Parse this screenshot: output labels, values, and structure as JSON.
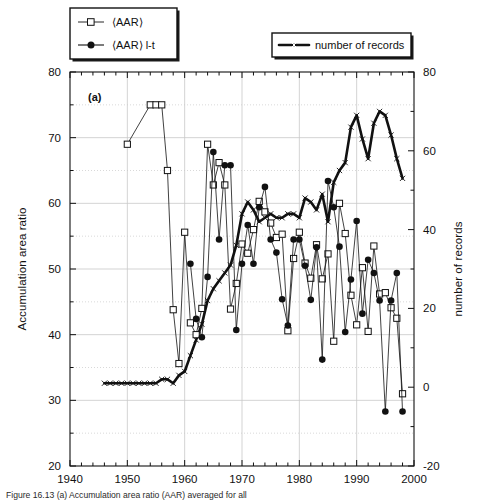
{
  "figure": {
    "panel_label": "(a)",
    "caption": "Figure 16.13   (a) Accumulation area ratio (AAR) averaged for all"
  },
  "legends": [
    {
      "id": "legend-aar",
      "entries": [
        {
          "label": "⟨AAR⟩",
          "marker": "open-square"
        },
        {
          "label": "⟨AAR⟩ l-t",
          "marker": "filled-circle"
        }
      ]
    },
    {
      "id": "legend-records",
      "entries": [
        {
          "label": "number of records",
          "marker": "cross"
        }
      ]
    }
  ],
  "colors": {
    "ink": "#111111",
    "grid": "#c8c8c8",
    "background": "#ffffff"
  },
  "chart_data": {
    "type": "line",
    "title": "",
    "xlabel": "",
    "ylabel": "Accumulation area ratio",
    "y2label": "number  of  records",
    "xlim": [
      1940,
      2000
    ],
    "ylim": [
      20,
      80
    ],
    "y2lim": [
      -20,
      80
    ],
    "xticks": [
      1940,
      1950,
      1960,
      1970,
      1980,
      1990,
      2000
    ],
    "yticks": [
      20,
      30,
      40,
      50,
      60,
      70,
      80
    ],
    "y2ticks": [
      -20,
      0,
      20,
      40,
      60,
      80
    ],
    "xminor_step": 2,
    "yminor_step": 5,
    "grid": true,
    "legend_position": "top",
    "series": [
      {
        "name": "⟨AAR⟩",
        "axis": "left",
        "marker": "open-square",
        "x": [
          1950,
          1954,
          1955,
          1956,
          1957,
          1958,
          1959,
          1960,
          1961,
          1962,
          1963,
          1964,
          1965,
          1966,
          1967,
          1968,
          1969,
          1970,
          1971,
          1972,
          1973,
          1974,
          1975,
          1976,
          1977,
          1978,
          1979,
          1980,
          1981,
          1982,
          1983,
          1984,
          1985,
          1986,
          1987,
          1988,
          1989,
          1990,
          1991,
          1992,
          1993,
          1994,
          1995,
          1996,
          1997,
          1998
        ],
        "y": [
          69.0,
          75.0,
          75.0,
          75.0,
          65.0,
          43.8,
          35.6,
          55.6,
          41.8,
          40.0,
          44.0,
          69.0,
          62.8,
          66.2,
          62.8,
          43.9,
          47.8,
          53.8,
          52.4,
          56.0,
          60.3,
          58.7,
          57.0,
          54.8,
          55.3,
          40.6,
          51.6,
          55.6,
          50.9,
          48.6,
          53.7,
          48.5,
          52.3,
          39.0,
          60.0,
          55.4,
          46.0,
          41.5,
          50.2,
          40.5,
          53.5,
          46.2,
          46.4,
          44.1,
          42.5,
          31.0
        ]
      },
      {
        "name": "⟨AAR⟩ l-t",
        "axis": "left",
        "marker": "filled-circle",
        "x": [
          1961,
          1962,
          1963,
          1964,
          1965,
          1966,
          1967,
          1968,
          1969,
          1970,
          1971,
          1972,
          1973,
          1974,
          1975,
          1976,
          1977,
          1978,
          1979,
          1980,
          1981,
          1982,
          1983,
          1984,
          1985,
          1986,
          1987,
          1988,
          1989,
          1990,
          1991,
          1992,
          1993,
          1994,
          1995,
          1996,
          1997,
          1998
        ],
        "y": [
          50.8,
          42.4,
          39.6,
          48.8,
          67.8,
          54.5,
          65.8,
          65.8,
          40.7,
          50.8,
          56.7,
          50.8,
          59.4,
          62.5,
          54.5,
          52.5,
          45.4,
          41.4,
          54.5,
          54.5,
          50.5,
          45.3,
          53.3,
          36.2,
          63.4,
          59.4,
          53.4,
          40.4,
          48.4,
          57.3,
          43.2,
          51.4,
          49.4,
          45.2,
          28.3,
          45.2,
          49.4,
          28.3
        ]
      },
      {
        "name": "number of records",
        "axis": "right",
        "marker": "cross",
        "x": [
          1946,
          1947,
          1948,
          1949,
          1950,
          1951,
          1952,
          1953,
          1954,
          1955,
          1956,
          1957,
          1958,
          1959,
          1960,
          1961,
          1962,
          1963,
          1964,
          1965,
          1966,
          1967,
          1968,
          1969,
          1970,
          1971,
          1972,
          1973,
          1974,
          1975,
          1976,
          1977,
          1978,
          1979,
          1980,
          1981,
          1982,
          1983,
          1984,
          1985,
          1986,
          1987,
          1988,
          1989,
          1990,
          1991,
          1992,
          1993,
          1994,
          1995,
          1996,
          1997,
          1998
        ],
        "y": [
          1,
          1,
          1,
          1,
          1,
          1,
          1,
          1,
          1,
          1,
          2,
          2,
          1,
          3,
          4,
          8,
          12,
          16,
          22,
          25,
          27,
          29,
          31,
          36,
          44,
          47,
          45,
          42,
          43,
          44,
          43,
          43,
          44,
          44,
          43,
          48,
          47,
          45,
          49,
          42,
          52,
          55,
          57,
          66,
          69,
          63,
          58,
          67,
          70,
          69,
          64,
          58,
          53
        ]
      }
    ]
  }
}
